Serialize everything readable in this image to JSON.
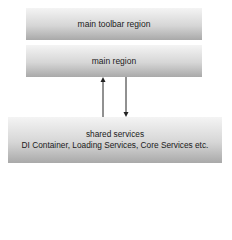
{
  "diagram": {
    "boxes": [
      {
        "id": "main-toolbar-region",
        "label": "main toolbar region"
      },
      {
        "id": "main-region",
        "label": "main region"
      },
      {
        "id": "shared-services",
        "label": "shared services",
        "sublabel": "DI Container, Loading Services, Core Services etc."
      }
    ],
    "edges": [
      {
        "from": "shared-services",
        "to": "main-region",
        "direction": "up"
      },
      {
        "from": "main-region",
        "to": "shared-services",
        "direction": "down"
      }
    ],
    "colors": {
      "box_gradient_top": "#f4f4f4",
      "box_gradient_bottom": "#a9a9a9",
      "arrow": "#222222",
      "text": "#1a1a1a"
    }
  }
}
